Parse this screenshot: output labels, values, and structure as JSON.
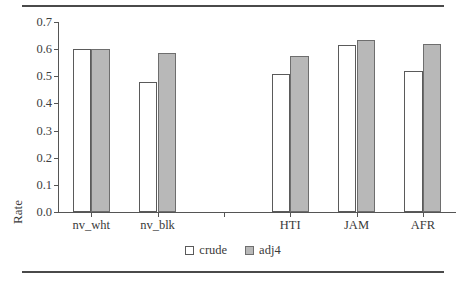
{
  "chart_data": {
    "type": "bar",
    "title": "",
    "xlabel": "",
    "ylabel": "Rate",
    "ylim": [
      0.0,
      0.7
    ],
    "grid": false,
    "legend_position": "bottom-center",
    "categories": [
      "nv_wht",
      "nv_blk",
      "",
      "HTI",
      "JAM",
      "AFR"
    ],
    "ytick_labels": [
      "0.0",
      "0.1",
      "0.2",
      "0.3",
      "0.4",
      "0.5",
      "0.6",
      "0.7"
    ],
    "ytick_values": [
      0.0,
      0.1,
      0.2,
      0.3,
      0.4,
      0.5,
      0.6,
      0.7
    ],
    "series": [
      {
        "name": "crude",
        "color": "#ffffff",
        "values": [
          0.6,
          0.478,
          null,
          0.508,
          0.615,
          0.518
        ]
      },
      {
        "name": "adj4",
        "color": "#b8b8b8",
        "values": [
          0.6,
          0.585,
          null,
          0.573,
          0.635,
          0.62
        ]
      }
    ]
  },
  "legend": {
    "items": [
      {
        "label": "crude",
        "swatch": "open-square-icon"
      },
      {
        "label": "adj4",
        "swatch": "filled-square-icon"
      }
    ]
  },
  "axis": {
    "y_title": "Rate"
  }
}
